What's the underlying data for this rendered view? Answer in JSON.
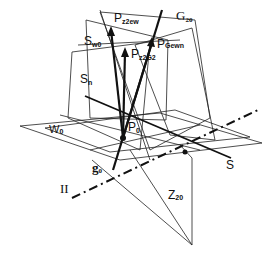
{
  "diagram": {
    "labels": {
      "pz2ew": {
        "main": "P",
        "sub": "z2ew"
      },
      "g20": {
        "main": "G",
        "sub": "20"
      },
      "sw0": {
        "main": "S",
        "sub": "w0"
      },
      "pgewn": {
        "main": "P",
        "sub": "Gewn"
      },
      "pz2g2": {
        "main": "P",
        "sub": "z2G2"
      },
      "sn": {
        "main": "S",
        "sub": "n"
      },
      "p0": {
        "main": "P",
        "sub": "0"
      },
      "w0": {
        "main": "W",
        "sub": "0"
      },
      "g0": {
        "main": "g",
        "sub": "0"
      },
      "s": {
        "main": "S"
      },
      "ii": {
        "main": "II"
      },
      "z20": {
        "main": "Z",
        "sub": "20"
      }
    },
    "colors": {
      "ink": "#111111",
      "background": "#ffffff"
    }
  }
}
